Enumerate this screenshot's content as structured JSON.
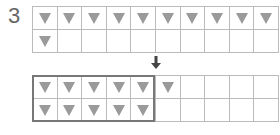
{
  "problem_number": "3",
  "top_grid": {
    "columns": 10,
    "rows": 2,
    "filled": [
      [
        1,
        1,
        1,
        1,
        1,
        1,
        1,
        1,
        1,
        1
      ],
      [
        1,
        0,
        0,
        0,
        0,
        0,
        0,
        0,
        0,
        0
      ]
    ],
    "total_triangles": 11
  },
  "bottom_grid": {
    "columns": 10,
    "rows": 2,
    "filled": [
      [
        1,
        1,
        1,
        1,
        1,
        1,
        0,
        0,
        0,
        0
      ],
      [
        1,
        1,
        1,
        1,
        1,
        0,
        0,
        0,
        0,
        0
      ]
    ],
    "highlight_box_columns": 5,
    "total_triangles": 11
  },
  "arrow": "down-arrow",
  "colors": {
    "triangle": "#9a9a9a",
    "grid_line": "#bbbbbb",
    "box": "#777777",
    "text": "#666666"
  }
}
